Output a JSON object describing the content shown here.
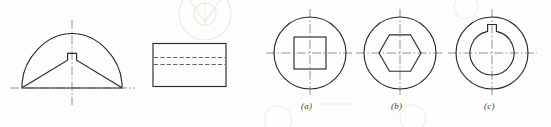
{
  "figure": {
    "kind": "engineering-drawing",
    "background_color": "#fdfdfc",
    "line_color": "#2b2b2b",
    "centerline_color": "#6e6e6e",
    "hidden_line_color": "#555555",
    "ghost_color": "#ece9e4"
  },
  "views": {
    "sectional_view": {
      "name": "front-sectional-view",
      "description": "Dome shaped part with V-shaped relief and rectangular keyway notch at apex",
      "outline": "M 22,88 L 22,83 C 24,58 46,34 72,34 C 98,34 120,58 122,83 L 122,88 Z",
      "inner_profile": "M 22,88 L 68,60 L 68,53 L 77,53 L 77,60 L 122,88",
      "center_x": 72,
      "baseline_y": 88,
      "apex_y": 34
    },
    "side_view": {
      "name": "side-rectangular-view",
      "description": "Rectangle with two hidden lines",
      "x": 153,
      "y": 43,
      "width": 73,
      "height": 43,
      "hidden_lines_y": [
        57,
        64
      ]
    },
    "end_views": [
      {
        "name": "end-view-square-bore",
        "label": "(a)",
        "bore_type": "square",
        "center_x": 310,
        "center_y": 53,
        "outer_radius": 36,
        "bore_half_size": 16
      },
      {
        "name": "end-view-hex-bore",
        "label": "(b)",
        "bore_type": "hexagon",
        "center_x": 400,
        "center_y": 53,
        "outer_radius": 36,
        "bore_radius": 21
      },
      {
        "name": "end-view-keyed-bore",
        "label": "(c)",
        "bore_type": "circle-with-keyway",
        "center_x": 492,
        "center_y": 53,
        "outer_radius": 36,
        "bore_radius": 22,
        "keyway_width": 9,
        "keyway_height": 7
      }
    ]
  },
  "labels": {
    "a": "(a)",
    "b": "(b)",
    "c": "(c)"
  },
  "label_positions": [
    {
      "key": "a",
      "left": 301,
      "top": 101
    },
    {
      "key": "b",
      "left": 391,
      "top": 101
    },
    {
      "key": "c",
      "left": 484,
      "top": 101
    }
  ]
}
